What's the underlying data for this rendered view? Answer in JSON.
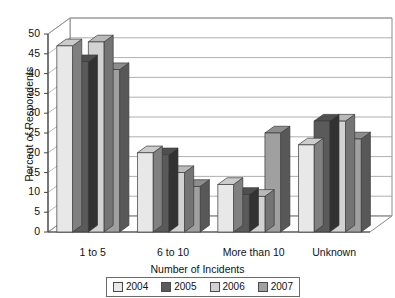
{
  "chart_data": {
    "type": "bar",
    "title": "",
    "xlabel": "Number of Incidents",
    "ylabel": "Percent of Respondents",
    "categories": [
      "1 to 5",
      "6 to 10",
      "More than 10",
      "Unknown"
    ],
    "series": [
      {
        "name": "2004",
        "color": "#e8e8e8",
        "values": [
          47,
          20,
          12,
          22
        ]
      },
      {
        "name": "2005",
        "color": "#5a5a5a",
        "values": [
          43,
          19.5,
          9.5,
          28
        ]
      },
      {
        "name": "2006",
        "color": "#d2d2d2",
        "values": [
          48,
          15,
          9,
          28
        ]
      },
      {
        "name": "2007",
        "color": "#a0a0a0",
        "values": [
          41,
          11.5,
          25,
          23.5
        ]
      }
    ],
    "ylim": [
      0,
      50
    ],
    "yticks": [
      0,
      5,
      10,
      15,
      20,
      25,
      30,
      35,
      40,
      45,
      50
    ],
    "grid": true,
    "legend_position": "bottom",
    "style": "3d-perspective"
  },
  "legend": {
    "items": [
      {
        "label": "2004",
        "color": "#e8e8e8"
      },
      {
        "label": "2005",
        "color": "#5a5a5a"
      },
      {
        "label": "2006",
        "color": "#d2d2d2"
      },
      {
        "label": "2007",
        "color": "#a0a0a0"
      }
    ]
  }
}
